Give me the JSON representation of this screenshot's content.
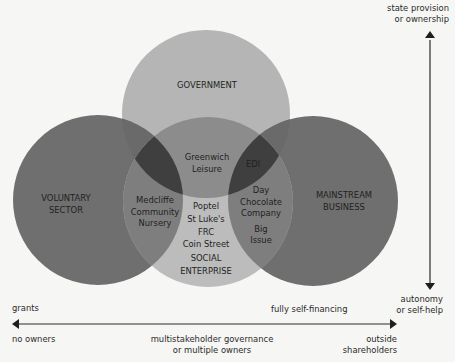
{
  "diagram": {
    "type": "venn",
    "circles": [
      {
        "id": "government",
        "label": "GOVERNMENT"
      },
      {
        "id": "voluntary",
        "label_lines": [
          "VOLUNTARY",
          "SECTOR"
        ]
      },
      {
        "id": "mainstream",
        "label_lines": [
          "MAINSTREAM",
          "BUSINESS"
        ]
      },
      {
        "id": "social",
        "label_lines": [
          "SOCIAL",
          "ENTERPRISE"
        ]
      }
    ],
    "examples": {
      "gov_social": [
        "Greenwich",
        "Leisure"
      ],
      "gov_social_mainstream": "EDI",
      "voluntary_social": [
        "Medcliffe",
        "Community",
        "Nursery"
      ],
      "social_only": [
        "Poptel",
        "St Luke's",
        "FRC",
        "Coin Street"
      ],
      "social_mainstream": [
        "Day",
        "Chocolate",
        "Company",
        "Big",
        "Issue"
      ]
    },
    "colors": {
      "background": "#f6f6f4",
      "government": "#b5b5b5",
      "voluntary": "#6f6f6f",
      "mainstream": "#6f6f6f",
      "social": "#bcbcbc",
      "arrow": "#1f1f1f"
    }
  },
  "vertical_axis": {
    "top_lines": [
      "state provision",
      "or ownership"
    ],
    "bottom_lines": [
      "autonomy",
      "or self-help"
    ]
  },
  "horizontal_axis": {
    "upper_left": "grants",
    "upper_right": "fully self-financing",
    "lower_left": "no owners",
    "lower_middle": [
      "multistakeholder governance",
      "or multiple owners"
    ],
    "lower_right": [
      "outside",
      "shareholders"
    ]
  }
}
